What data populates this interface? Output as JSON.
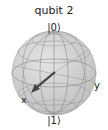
{
  "title": "qubit 2",
  "labels": {
    "zero": "|0⟩",
    "one": "|1⟩",
    "x": "x",
    "y": "y"
  },
  "colors": {
    "sphere_fill": "#cfcfcf",
    "wire": "#8a8a8a",
    "vector": "#444444",
    "text": "#222222"
  }
}
